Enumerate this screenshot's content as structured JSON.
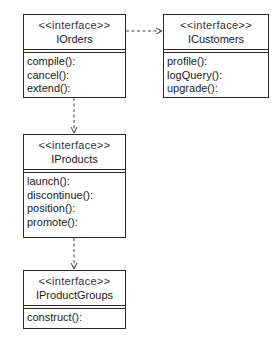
{
  "diagram": {
    "type": "UML interface dependency diagram",
    "classes": [
      {
        "id": "iorders",
        "stereotype": "<<interface>>",
        "name": "IOrders",
        "operations": [
          "compile():",
          "cancel():",
          "extend():"
        ]
      },
      {
        "id": "icustomers",
        "stereotype": "<<interface>>",
        "name": "ICustomers",
        "operations": [
          "profile():",
          "logQuery():",
          "upgrade():"
        ]
      },
      {
        "id": "iproducts",
        "stereotype": "<<interface>>",
        "name": "IProducts",
        "operations": [
          "launch():",
          "discontinue():",
          "position():",
          "promote():"
        ]
      },
      {
        "id": "iproductgroups",
        "stereotype": "<<interface>>",
        "name": "IProductGroups",
        "operations": [
          "construct():"
        ]
      }
    ],
    "dependencies": [
      {
        "from": "IOrders",
        "to": "ICustomers",
        "style": "dashed-open-arrow"
      },
      {
        "from": "IOrders",
        "to": "IProducts",
        "style": "dashed-open-arrow"
      },
      {
        "from": "IProducts",
        "to": "IProductGroups",
        "style": "dashed-open-arrow"
      }
    ],
    "colors": {
      "line": "#2a2a2a",
      "background": "#ffffff"
    }
  }
}
